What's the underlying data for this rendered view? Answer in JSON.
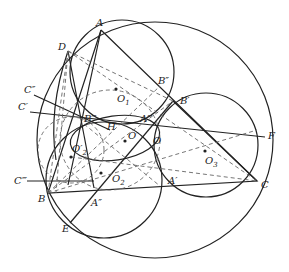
{
  "diagram": {
    "type": "geometry-construction",
    "stroke_color": "#222222",
    "dash_color": "#666666",
    "points": [
      {
        "name": "A",
        "label": "A",
        "x": 101,
        "y": 30,
        "lx": 96,
        "ly": 26
      },
      {
        "name": "D",
        "label": "D",
        "x": 68,
        "y": 51,
        "lx": 58,
        "ly": 50
      },
      {
        "name": "C2",
        "label": "C″",
        "x": 34,
        "y": 95,
        "lx": 24,
        "ly": 93
      },
      {
        "name": "C1",
        "label": "C′",
        "x": 30,
        "y": 112,
        "lx": 18,
        "ly": 110
      },
      {
        "name": "B2",
        "label": "B″",
        "x": 160,
        "y": 86,
        "lx": 158,
        "ly": 84
      },
      {
        "name": "B1",
        "label": "B′",
        "x": 173,
        "y": 101,
        "lx": 180,
        "ly": 104
      },
      {
        "name": "B3",
        "label": "B‴",
        "x": 84,
        "y": 124,
        "lx": 84,
        "ly": 122
      },
      {
        "name": "O1",
        "label": "O",
        "sub": "1",
        "x": 116,
        "y": 89,
        "lx": 117,
        "ly": 102
      },
      {
        "name": "H",
        "label": "H",
        "x": 107,
        "y": 132,
        "lx": 107,
        "ly": 130
      },
      {
        "name": "A3",
        "label": "A‴",
        "x": 140,
        "y": 121,
        "lx": 140,
        "ly": 122
      },
      {
        "name": "O_prime",
        "label": "O′",
        "x": 125,
        "y": 141,
        "lx": 128,
        "ly": 139
      },
      {
        "name": "O",
        "label": "O",
        "x": 148,
        "y": 141,
        "lx": 153,
        "ly": 144
      },
      {
        "name": "O2p",
        "label": "O′",
        "sub": "2",
        "x": 71,
        "y": 157,
        "lx": 72,
        "ly": 152
      },
      {
        "name": "O2",
        "label": "O",
        "sub": "2",
        "x": 101,
        "y": 173,
        "lx": 112,
        "ly": 182
      },
      {
        "name": "C3",
        "label": "C‴",
        "x": 27,
        "y": 181,
        "lx": 14,
        "ly": 184
      },
      {
        "name": "B",
        "label": "B",
        "x": 48,
        "y": 193,
        "lx": 38,
        "ly": 202
      },
      {
        "name": "A2",
        "label": "A″",
        "x": 94,
        "y": 188,
        "lx": 91,
        "ly": 206
      },
      {
        "name": "A1",
        "label": "A′",
        "x": 160,
        "y": 186,
        "lx": 168,
        "ly": 184
      },
      {
        "name": "C",
        "label": "C",
        "x": 257,
        "y": 181,
        "lx": 261,
        "ly": 188
      },
      {
        "name": "O3",
        "label": "O",
        "sub": "3",
        "x": 205,
        "y": 151,
        "lx": 205,
        "ly": 164
      },
      {
        "name": "F",
        "label": "F",
        "x": 265,
        "y": 137,
        "lx": 268,
        "ly": 139
      },
      {
        "name": "E",
        "label": "E",
        "x": 70,
        "y": 223,
        "lx": 62,
        "ly": 232
      }
    ]
  }
}
